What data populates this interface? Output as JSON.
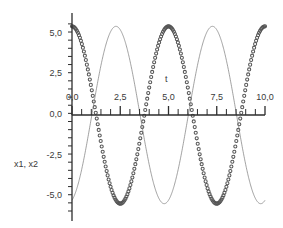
{
  "chart_data": {
    "type": "line",
    "title": "",
    "subtitle": "",
    "xlabel": "t",
    "ylabel": "x1, x2",
    "xlim": [
      0.0,
      10.0
    ],
    "ylim": [
      -6.0,
      6.0
    ],
    "grid": false,
    "legend": "none",
    "x_ticks": [
      {
        "value": 0.0,
        "label": "0,0"
      },
      {
        "value": 2.5,
        "label": "2,5"
      },
      {
        "value": 5.0,
        "label": "5,0"
      },
      {
        "value": 7.5,
        "label": "7,5"
      },
      {
        "value": 10.0,
        "label": "10,0"
      }
    ],
    "y_ticks": [
      {
        "value": 5.0,
        "label": "5,0"
      },
      {
        "value": 2.5,
        "label": "2,5"
      },
      {
        "value": 0.0,
        "label": "0,0"
      },
      {
        "value": -2.5,
        "label": "-2,5"
      },
      {
        "value": -5.0,
        "label": "-5,0"
      }
    ],
    "x_minor_ticks_per_major": 5,
    "y_minor_ticks_per_major": 5,
    "series": [
      {
        "name": "x1",
        "style": "markers",
        "marker": "circle-open",
        "color": "#555555",
        "amplitude": 5.45,
        "period": 5.0,
        "phase_deg": 0.0,
        "description": "cosine-like, starts at maximum 5.45 at t=0",
        "x": [
          0.0,
          0.25,
          0.5,
          0.75,
          1.0,
          1.25,
          1.5,
          1.75,
          2.0,
          2.25,
          2.5,
          2.75,
          3.0,
          3.25,
          3.5,
          3.75,
          4.0,
          4.25,
          4.5,
          4.75,
          5.0,
          5.25,
          5.5,
          5.75,
          6.0,
          6.25,
          6.5,
          6.75,
          7.0,
          7.25,
          7.5,
          7.75,
          8.0,
          8.25,
          8.5,
          8.75,
          9.0,
          9.25,
          9.5,
          9.75,
          10.0
        ],
        "y": [
          5.45,
          5.29,
          4.81,
          4.05,
          3.05,
          1.88,
          0.63,
          -0.63,
          -1.88,
          -3.05,
          -4.05,
          -4.81,
          -5.29,
          -5.45,
          -5.29,
          -4.81,
          -4.05,
          -3.05,
          -1.88,
          -0.63,
          0.63,
          1.88,
          3.05,
          4.05,
          4.81,
          5.29,
          5.45,
          5.29,
          4.81,
          4.05,
          3.05,
          1.88,
          0.63,
          -0.63,
          -1.88,
          -3.05,
          -4.05,
          -4.81,
          -5.29,
          -5.45,
          -5.29
        ]
      },
      {
        "name": "x2",
        "style": "line",
        "marker": "none",
        "color": "#7a7a7a",
        "amplitude": 5.45,
        "period": 5.0,
        "phase_deg": 196.0,
        "description": "thin sine, starts near 1.5 at t=0 and descends to trough near t=1.9",
        "x": [
          0.0,
          0.25,
          0.5,
          0.75,
          1.0,
          1.25,
          1.5,
          1.75,
          2.0,
          2.25,
          2.5,
          2.75,
          3.0,
          3.25,
          3.5,
          3.75,
          4.0,
          4.25,
          4.5,
          4.75,
          5.0,
          5.25,
          5.5,
          5.75,
          6.0,
          6.25,
          6.5,
          6.75,
          7.0,
          7.25,
          7.5,
          7.75,
          8.0,
          8.25,
          8.5,
          8.75,
          9.0,
          9.25,
          9.5,
          9.75,
          10.0
        ],
        "y": [
          1.5,
          0.15,
          -1.25,
          -2.6,
          -3.75,
          -4.7,
          -5.3,
          -5.45,
          -5.2,
          -4.6,
          -3.6,
          -2.35,
          -1.0,
          0.4,
          1.8,
          3.1,
          4.2,
          5.0,
          5.4,
          5.45,
          5.05,
          4.3,
          3.25,
          2.0,
          0.6,
          -0.8,
          -2.2,
          -3.4,
          -4.4,
          -5.1,
          -5.45,
          -5.4,
          -4.95,
          -4.15,
          -3.1,
          -1.8,
          -0.4,
          1.0,
          2.35,
          3.6,
          4.6
        ]
      }
    ]
  },
  "axes": {
    "x_axis_name": "t-axis",
    "y_axis_name": "x1-x2-axis"
  }
}
